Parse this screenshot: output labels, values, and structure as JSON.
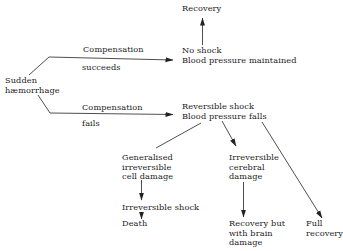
{
  "diagram": {
    "nodes": {
      "start": {
        "line1": "Sudden",
        "line2": "hæmorrhage"
      },
      "comp_succeeds": {
        "line1": "Compensation",
        "line2": "succeeds"
      },
      "comp_fails": {
        "line1": "Compensation",
        "line2": "fails"
      },
      "recovery": {
        "line1": "Recovery"
      },
      "no_shock": {
        "line1": "No shock",
        "line2": "Blood pressure maintained"
      },
      "reversible_shock": {
        "line1": "Reversible shock",
        "line2": "Blood pressure falls"
      },
      "cell_damage": {
        "line1": "Generalised",
        "line2": "irreversible",
        "line3": "cell damage"
      },
      "irreversible_shock": {
        "line1": "Irreversible shock"
      },
      "death": {
        "line1": "Death"
      },
      "cerebral_damage": {
        "line1": "Irreversible",
        "line2": "cerebral",
        "line3": "damage"
      },
      "brain_recovery": {
        "line1": "Recovery but",
        "line2": "with brain",
        "line3": "damage"
      },
      "full_recovery": {
        "line1": "Full",
        "line2": "recovery"
      }
    },
    "edges": [
      {
        "from": "Sudden hæmorrhage",
        "to": "No shock / Blood pressure maintained",
        "label": "Compensation succeeds"
      },
      {
        "from": "Sudden hæmorrhage",
        "to": "Reversible shock / Blood pressure falls",
        "label": "Compensation fails"
      },
      {
        "from": "No shock / Blood pressure maintained",
        "to": "Recovery"
      },
      {
        "from": "Reversible shock / Blood pressure falls",
        "to": "Generalised irreversible cell damage"
      },
      {
        "from": "Reversible shock / Blood pressure falls",
        "to": "Irreversible cerebral damage"
      },
      {
        "from": "Reversible shock / Blood pressure falls",
        "to": "Full recovery"
      },
      {
        "from": "Generalised irreversible cell damage",
        "to": "Irreversible shock"
      },
      {
        "from": "Irreversible shock",
        "to": "Death"
      },
      {
        "from": "Irreversible cerebral damage",
        "to": "Recovery but with brain damage"
      }
    ],
    "colors": {
      "ink": "#222222",
      "background": "#ffffff"
    }
  }
}
